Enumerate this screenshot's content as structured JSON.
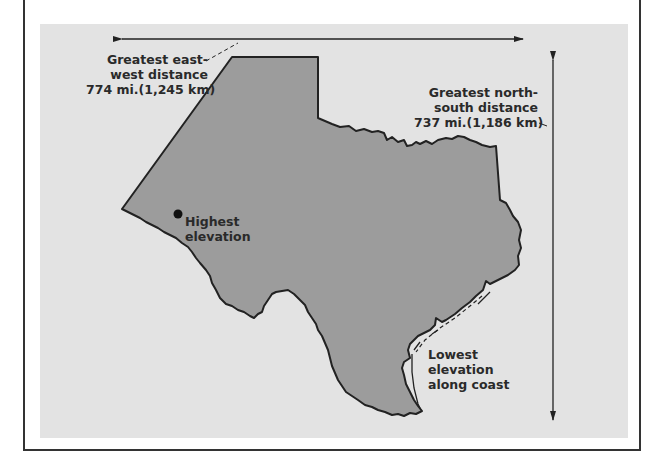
{
  "colors": {
    "background": "#ffffff",
    "panel": "#e3e3e3",
    "land": "#9c9c9c",
    "outline": "#222222",
    "text": "#2a2a2a"
  },
  "labels": {
    "east_west": {
      "line1": "Greatest east-",
      "line2": "west distance",
      "line3": "774 mi.(1,245 km)"
    },
    "north_south": {
      "line1": "Greatest north-",
      "line2": "south distance",
      "line3": "737 mi.(1,186 km)"
    },
    "highest": {
      "line1": "Highest",
      "line2": "elevation"
    },
    "lowest": {
      "line1": "Lowest",
      "line2": "elevation",
      "line3": "along coast"
    }
  },
  "features": {
    "region": "Texas",
    "markers": [
      "highest-elevation-point"
    ],
    "arrows": [
      "east-west-distance-arrow",
      "north-south-distance-arrow"
    ]
  }
}
